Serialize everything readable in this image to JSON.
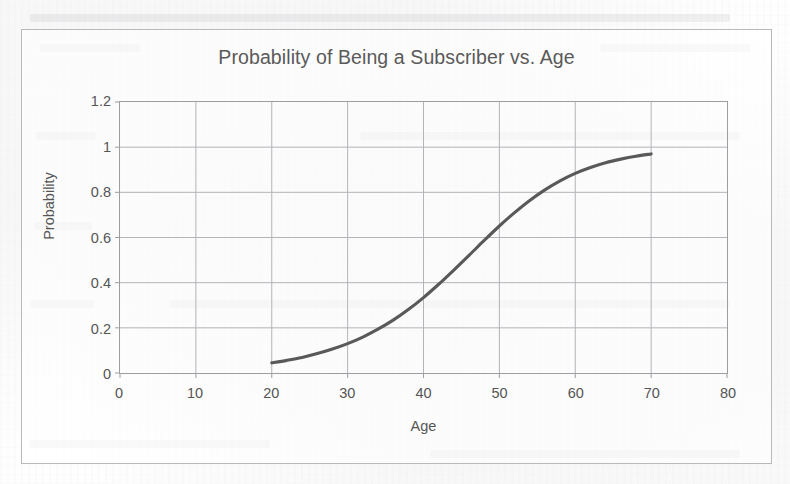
{
  "chart_data": {
    "type": "line",
    "title": "Probability of Being a Subscriber vs. Age",
    "xlabel": "Age",
    "ylabel": "Probability",
    "xlim": [
      0,
      80
    ],
    "ylim": [
      0,
      1.2
    ],
    "xticks": [
      "0",
      "10",
      "20",
      "30",
      "40",
      "50",
      "60",
      "70",
      "80"
    ],
    "yticks": [
      "0",
      "0.2",
      "0.4",
      "0.6",
      "0.8",
      "1",
      "1.2"
    ],
    "grid": "both",
    "legend": "none",
    "series": [
      {
        "name": "Probability of Being a Subscriber",
        "color": "#595959",
        "x": [
          20,
          22,
          24,
          26,
          28,
          30,
          32,
          34,
          36,
          38,
          40,
          42,
          44,
          46,
          48,
          50,
          52,
          54,
          56,
          58,
          60,
          62,
          64,
          66,
          68,
          70
        ],
        "y": [
          0.045,
          0.056,
          0.069,
          0.086,
          0.106,
          0.13,
          0.159,
          0.194,
          0.234,
          0.281,
          0.334,
          0.393,
          0.456,
          0.521,
          0.587,
          0.651,
          0.71,
          0.764,
          0.811,
          0.851,
          0.884,
          0.91,
          0.931,
          0.947,
          0.96,
          0.97
        ]
      }
    ]
  },
  "chart_style": {
    "curve_color": "#595959",
    "grid_color": "#b4b4b9",
    "axis_color": "#9d9da2",
    "text_color": "#555555",
    "title_color": "#5a5a5a",
    "frame_color": "#b9b9bd"
  }
}
